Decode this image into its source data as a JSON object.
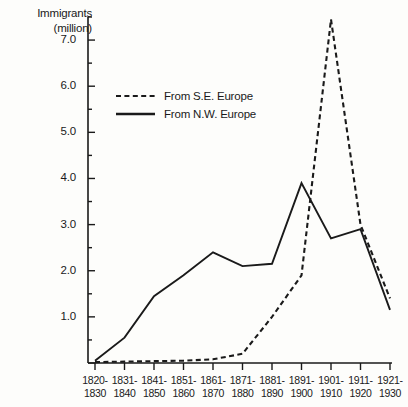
{
  "chart_data": {
    "type": "line",
    "title": "",
    "ylabel": "Immigrants\n(million)",
    "xlabel": "",
    "ylim": [
      0,
      7.5
    ],
    "yticks": [
      "1.0",
      "2.0",
      "3.0",
      "4.0",
      "5.0",
      "6.0",
      "7.0"
    ],
    "ytick_values": [
      1.0,
      2.0,
      3.0,
      4.0,
      5.0,
      6.0,
      7.0
    ],
    "minor_tick_step": 0.5,
    "grid": false,
    "legend_position": "upper-left-inside",
    "categories": [
      "1820-\n1830",
      "1831-\n1840",
      "1841-\n1850",
      "1851-\n1860",
      "1861-\n1870",
      "1871-\n1880",
      "1881-\n1890",
      "1891-\n1900",
      "1901-\n1910",
      "1911-\n1920",
      "1921-\n1930"
    ],
    "series": [
      {
        "name": "From S.E. Europe",
        "style": "dashed",
        "values": [
          0.02,
          0.03,
          0.04,
          0.05,
          0.08,
          0.2,
          1.0,
          1.9,
          7.45,
          3.0,
          1.4
        ]
      },
      {
        "name": "From N.W. Europe",
        "style": "solid",
        "values": [
          0.05,
          0.55,
          1.45,
          1.9,
          2.4,
          2.1,
          2.15,
          3.9,
          2.7,
          2.9,
          1.15
        ]
      }
    ]
  },
  "legend": {
    "entries": [
      {
        "label": "From S.E. Europe",
        "style": "dashed"
      },
      {
        "label": "From N.W. Europe",
        "style": "solid"
      }
    ]
  },
  "colors": {
    "ink": "#1a1a1a",
    "background": "#fdfdfb"
  }
}
